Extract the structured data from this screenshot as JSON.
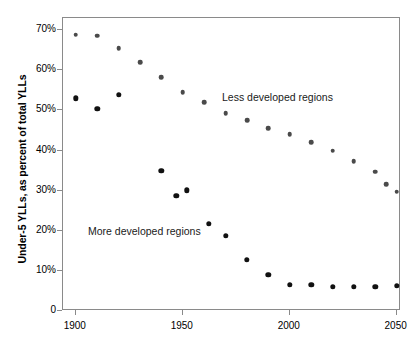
{
  "figure": {
    "ylabel": "Under-5 YLLs, as percent of total YLLs",
    "caption_partial": ""
  },
  "annotations": {
    "less": "Less developed regions",
    "more": "More developed regions"
  },
  "axes": {
    "y_ticklabels": [
      "70%",
      "60%",
      "50%",
      "40%",
      "30%",
      "20%",
      "10%",
      "0"
    ],
    "y_tickvalues": [
      70,
      60,
      50,
      40,
      30,
      20,
      10,
      0
    ],
    "x_ticklabels": [
      "1900",
      "1950",
      "2000",
      "2050"
    ],
    "x_tickvalues": [
      1900,
      1950,
      2000,
      2050
    ]
  },
  "chart_data": {
    "type": "scatter",
    "title": "",
    "xlabel": "",
    "ylabel": "Under-5 YLLs, as percent of total YLLs",
    "xlim": [
      1894,
      2052
    ],
    "ylim": [
      0,
      73
    ],
    "grid": false,
    "legend": "inline-annotations",
    "series": [
      {
        "name": "Less developed regions",
        "color": "#4a4a4a",
        "marker": "circle",
        "points": [
          {
            "x": 1900,
            "y": 68.8
          },
          {
            "x": 1910,
            "y": 68.6
          },
          {
            "x": 1920,
            "y": 65.5
          },
          {
            "x": 1930,
            "y": 62.0
          },
          {
            "x": 1940,
            "y": 58.3
          },
          {
            "x": 1950,
            "y": 54.5
          },
          {
            "x": 1960,
            "y": 52.0
          },
          {
            "x": 1970,
            "y": 49.3
          },
          {
            "x": 1980,
            "y": 47.5
          },
          {
            "x": 1990,
            "y": 45.5
          },
          {
            "x": 2000,
            "y": 44.0
          },
          {
            "x": 2010,
            "y": 42.0
          },
          {
            "x": 2020,
            "y": 40.0
          },
          {
            "x": 2030,
            "y": 37.3
          },
          {
            "x": 2040,
            "y": 34.7
          },
          {
            "x": 2045,
            "y": 31.6
          },
          {
            "x": 2050,
            "y": 29.7
          }
        ]
      },
      {
        "name": "More developed regions",
        "color": "#111111",
        "marker": "circle",
        "points": [
          {
            "x": 1900,
            "y": 53.0
          },
          {
            "x": 1910,
            "y": 50.4
          },
          {
            "x": 1920,
            "y": 53.9
          },
          {
            "x": 1940,
            "y": 35.0
          },
          {
            "x": 1947,
            "y": 28.7
          },
          {
            "x": 1952,
            "y": 30.1
          },
          {
            "x": 1962,
            "y": 21.8
          },
          {
            "x": 1970,
            "y": 18.8
          },
          {
            "x": 1980,
            "y": 12.7
          },
          {
            "x": 1990,
            "y": 9.0
          },
          {
            "x": 2000,
            "y": 6.6
          },
          {
            "x": 2010,
            "y": 6.5
          },
          {
            "x": 2020,
            "y": 6.0
          },
          {
            "x": 2030,
            "y": 6.0
          },
          {
            "x": 2040,
            "y": 6.0
          },
          {
            "x": 2050,
            "y": 6.3
          }
        ]
      }
    ]
  }
}
